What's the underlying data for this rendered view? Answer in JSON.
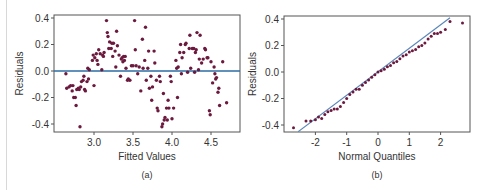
{
  "chart_data": [
    {
      "type": "scatter",
      "panel_label": "(a)",
      "title": "",
      "xlabel": "Fitted Values",
      "ylabel": "Residuals",
      "xlim": [
        2.6,
        4.8
      ],
      "ylim": [
        -0.45,
        0.42
      ],
      "xticks": [
        "3.0",
        "3.5",
        "4.0",
        "4.5"
      ],
      "yticks": [
        "0.4",
        "0.2",
        "0.0",
        "-0.2",
        "-0.4"
      ],
      "reference_line": {
        "y": 0.0,
        "color": "#2b6ca3"
      },
      "point_color": "#6b1a3e",
      "points": [
        [
          2.64,
          -0.02
        ],
        [
          2.65,
          -0.13
        ],
        [
          2.68,
          -0.12
        ],
        [
          2.7,
          -0.11
        ],
        [
          2.72,
          -0.15
        ],
        [
          2.73,
          -0.11
        ],
        [
          2.74,
          -0.2
        ],
        [
          2.76,
          -0.2
        ],
        [
          2.77,
          -0.26
        ],
        [
          2.78,
          -0.14
        ],
        [
          2.8,
          -0.13
        ],
        [
          2.81,
          -0.14
        ],
        [
          2.82,
          -0.42
        ],
        [
          2.83,
          -0.12
        ],
        [
          2.84,
          -0.08
        ],
        [
          2.86,
          -0.07
        ],
        [
          2.87,
          -0.04
        ],
        [
          2.88,
          -0.14
        ],
        [
          2.89,
          -0.15
        ],
        [
          2.91,
          -0.08
        ],
        [
          2.92,
          0.02
        ],
        [
          2.93,
          -0.06
        ],
        [
          2.94,
          0.01
        ],
        [
          2.98,
          0.08
        ],
        [
          2.99,
          0.12
        ],
        [
          3.0,
          -0.11
        ],
        [
          3.01,
          0.1
        ],
        [
          3.03,
          0.13
        ],
        [
          3.04,
          0.08
        ],
        [
          3.05,
          0.05
        ],
        [
          3.06,
          0.16
        ],
        [
          3.08,
          0.13
        ],
        [
          3.1,
          0.01
        ],
        [
          3.11,
          0.12
        ],
        [
          3.12,
          0.11
        ],
        [
          3.13,
          0.14
        ],
        [
          3.16,
          0.38
        ],
        [
          3.17,
          0.29
        ],
        [
          3.18,
          0.26
        ],
        [
          3.19,
          0.17
        ],
        [
          3.2,
          0.22
        ],
        [
          3.22,
          0.17
        ],
        [
          3.23,
          0.21
        ],
        [
          3.24,
          0.11
        ],
        [
          3.25,
          0.21
        ],
        [
          3.27,
          0.15
        ],
        [
          3.28,
          0.03
        ],
        [
          3.29,
          0.3
        ],
        [
          3.3,
          0.19
        ],
        [
          3.32,
          0.12
        ],
        [
          3.34,
          -0.04
        ],
        [
          3.35,
          0.09
        ],
        [
          3.36,
          0.1
        ],
        [
          3.37,
          0.07
        ],
        [
          3.38,
          0.11
        ],
        [
          3.39,
          0.08
        ],
        [
          3.4,
          0.11
        ],
        [
          3.41,
          0.02
        ],
        [
          3.43,
          -0.07
        ],
        [
          3.44,
          -0.06
        ],
        [
          3.46,
          -0.07
        ],
        [
          3.48,
          0.04
        ],
        [
          3.5,
          0.04
        ],
        [
          3.52,
          0.38
        ],
        [
          3.53,
          0.16
        ],
        [
          3.54,
          0.04
        ],
        [
          3.56,
          -0.02
        ],
        [
          3.58,
          0.03
        ],
        [
          3.6,
          -0.15
        ],
        [
          3.62,
          0.24
        ],
        [
          3.63,
          0.02
        ],
        [
          3.65,
          0.08
        ],
        [
          3.66,
          0.33
        ],
        [
          3.67,
          -0.07
        ],
        [
          3.69,
          0.02
        ],
        [
          3.7,
          0.15
        ],
        [
          3.71,
          -0.13
        ],
        [
          3.73,
          -0.04
        ],
        [
          3.74,
          -0.22
        ],
        [
          3.75,
          -0.12
        ],
        [
          3.77,
          0.15
        ],
        [
          3.78,
          0.06
        ],
        [
          3.8,
          -0.07
        ],
        [
          3.81,
          -0.28
        ],
        [
          3.82,
          -0.3
        ],
        [
          3.84,
          -0.04
        ],
        [
          3.85,
          -0.08
        ],
        [
          3.87,
          -0.42
        ],
        [
          3.88,
          -0.4
        ],
        [
          3.89,
          -0.17
        ],
        [
          3.9,
          -0.37
        ],
        [
          3.91,
          -0.35
        ],
        [
          3.93,
          -0.28
        ],
        [
          3.94,
          -0.37
        ],
        [
          3.95,
          -0.22
        ],
        [
          3.96,
          -0.28
        ],
        [
          3.98,
          -0.04
        ],
        [
          3.99,
          -0.08
        ],
        [
          4.0,
          -0.36
        ],
        [
          4.02,
          -0.28
        ],
        [
          4.05,
          0.08
        ],
        [
          4.06,
          0.02
        ],
        [
          4.07,
          -0.2
        ],
        [
          4.08,
          0.03
        ],
        [
          4.1,
          0.14
        ],
        [
          4.11,
          0.2
        ],
        [
          4.12,
          -0.02
        ],
        [
          4.13,
          0.1
        ],
        [
          4.15,
          0.14
        ],
        [
          4.17,
          0.2
        ],
        [
          4.18,
          0.21
        ],
        [
          4.2,
          -0.01
        ],
        [
          4.22,
          0.17
        ],
        [
          4.23,
          0.27
        ],
        [
          4.24,
          0.02
        ],
        [
          4.26,
          0.17
        ],
        [
          4.28,
          0.17
        ],
        [
          4.29,
          -0.01
        ],
        [
          4.3,
          0.14
        ],
        [
          4.31,
          0.16
        ],
        [
          4.32,
          0.29
        ],
        [
          4.34,
          0.01
        ],
        [
          4.35,
          0.09
        ],
        [
          4.36,
          0.27
        ],
        [
          4.38,
          0.06
        ],
        [
          4.4,
          0.09
        ],
        [
          4.42,
          0.17
        ],
        [
          4.43,
          0.16
        ],
        [
          4.45,
          0.1
        ],
        [
          4.46,
          0.1
        ],
        [
          4.48,
          -0.3
        ],
        [
          4.49,
          -0.33
        ],
        [
          4.5,
          0.07
        ],
        [
          4.52,
          -0.09
        ],
        [
          4.54,
          0.03
        ],
        [
          4.55,
          -0.02
        ],
        [
          4.56,
          -0.06
        ],
        [
          4.57,
          -0.05
        ],
        [
          4.59,
          -0.16
        ],
        [
          4.6,
          -0.13
        ],
        [
          4.61,
          -0.26
        ],
        [
          4.65,
          0.07
        ],
        [
          4.7,
          -0.24
        ]
      ]
    },
    {
      "type": "scatter",
      "panel_label": "(b)",
      "title": "",
      "xlabel": "Normal Quantiles",
      "ylabel": "Residuals",
      "xlim": [
        -2.85,
        3.0
      ],
      "ylim": [
        -0.45,
        0.42
      ],
      "xticks": [
        "-2",
        "-1",
        "0",
        "1",
        "2"
      ],
      "yticks": [
        "0.4",
        "0.2",
        "0.0",
        "-0.2",
        "-0.4"
      ],
      "reference_line": {
        "from": [
          -2.55,
          -0.45
        ],
        "to": [
          2.3,
          0.41
        ],
        "color": "#5b86b8"
      },
      "point_color": "#6b1a3e",
      "description": "Normal Q-Q plot; points lie close to the reference line with slight right-tail departure",
      "points": [
        [
          -2.7,
          -0.42
        ],
        [
          -2.3,
          -0.37
        ],
        [
          -2.15,
          -0.37
        ],
        [
          -2.0,
          -0.36
        ],
        [
          -1.9,
          -0.34
        ],
        [
          -1.8,
          -0.35
        ],
        [
          -1.7,
          -0.32
        ],
        [
          -1.6,
          -0.3
        ],
        [
          -1.5,
          -0.29
        ],
        [
          -1.4,
          -0.28
        ],
        [
          -1.3,
          -0.28
        ],
        [
          -1.2,
          -0.26
        ],
        [
          -1.1,
          -0.23
        ],
        [
          -1.0,
          -0.2
        ],
        [
          -0.9,
          -0.17
        ],
        [
          -0.8,
          -0.15
        ],
        [
          -0.7,
          -0.13
        ],
        [
          -0.6,
          -0.13
        ],
        [
          -0.5,
          -0.1
        ],
        [
          -0.4,
          -0.08
        ],
        [
          -0.3,
          -0.06
        ],
        [
          -0.2,
          -0.04
        ],
        [
          -0.1,
          -0.02
        ],
        [
          0.0,
          0.0
        ],
        [
          0.1,
          0.01
        ],
        [
          0.2,
          0.02
        ],
        [
          0.3,
          0.04
        ],
        [
          0.4,
          0.05
        ],
        [
          0.5,
          0.07
        ],
        [
          0.6,
          0.08
        ],
        [
          0.7,
          0.1
        ],
        [
          0.8,
          0.12
        ],
        [
          0.9,
          0.13
        ],
        [
          1.0,
          0.15
        ],
        [
          1.1,
          0.16
        ],
        [
          1.2,
          0.17
        ],
        [
          1.3,
          0.19
        ],
        [
          1.4,
          0.2
        ],
        [
          1.5,
          0.22
        ],
        [
          1.6,
          0.25
        ],
        [
          1.7,
          0.27
        ],
        [
          1.8,
          0.29
        ],
        [
          1.9,
          0.29
        ],
        [
          2.0,
          0.3
        ],
        [
          2.15,
          0.32
        ],
        [
          2.3,
          0.38
        ],
        [
          2.7,
          0.37
        ]
      ]
    }
  ]
}
